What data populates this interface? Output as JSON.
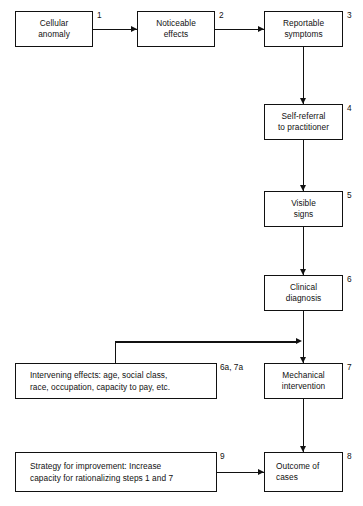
{
  "diagram": {
    "type": "flowchart",
    "width": 363,
    "height": 506,
    "background_color": "#ffffff",
    "line_color": "#111111"
  },
  "nodes": [
    {
      "id": "n1",
      "tag": "1",
      "label": "Cellular\nanomaly",
      "x": 15,
      "y": 11,
      "w": 78,
      "h": 36,
      "align": "center"
    },
    {
      "id": "n2",
      "tag": "2",
      "label": "Noticeable\neffects",
      "x": 137,
      "y": 11,
      "w": 78,
      "h": 36,
      "align": "center"
    },
    {
      "id": "n3",
      "tag": "3",
      "label": "Reportable\nsymptoms",
      "x": 264,
      "y": 11,
      "w": 79,
      "h": 36,
      "align": "center"
    },
    {
      "id": "n4",
      "tag": "4",
      "label": "Self-referral\nto practitioner",
      "x": 264,
      "y": 104,
      "w": 79,
      "h": 36,
      "align": "center"
    },
    {
      "id": "n5",
      "tag": "5",
      "label": "Visible\nsigns",
      "x": 264,
      "y": 191,
      "w": 79,
      "h": 36,
      "align": "center"
    },
    {
      "id": "n6",
      "tag": "6",
      "label": "Clinical\ndiagnosis",
      "x": 264,
      "y": 275,
      "w": 79,
      "h": 36,
      "align": "center"
    },
    {
      "id": "n6a7a",
      "tag": "6a, 7a",
      "label": "Intervening effects: age, social class,\nrace, occupation, capacity to pay, etc.",
      "x": 15,
      "y": 363,
      "w": 202,
      "h": 36,
      "align": "left"
    },
    {
      "id": "n7",
      "tag": "7",
      "label": "Mechanical\nintervention",
      "x": 264,
      "y": 363,
      "w": 79,
      "h": 36,
      "align": "center"
    },
    {
      "id": "n9",
      "tag": "9",
      "label": "Strategy for improvement: Increase\ncapacity for rationalizing steps 1 and 7",
      "x": 15,
      "y": 452,
      "w": 202,
      "h": 40,
      "align": "left"
    },
    {
      "id": "n8",
      "tag": "8",
      "label": "Outcome of\ncases",
      "x": 264,
      "y": 452,
      "w": 79,
      "h": 40,
      "align": "leftish"
    }
  ],
  "edges": [
    {
      "from": "n1",
      "to": "n2",
      "kind": "horizontal-arrow"
    },
    {
      "from": "n2",
      "to": "n3",
      "kind": "horizontal-arrow"
    },
    {
      "from": "n3",
      "to": "n4",
      "kind": "vertical-arrow"
    },
    {
      "from": "n4",
      "to": "n5",
      "kind": "vertical-arrow"
    },
    {
      "from": "n5",
      "to": "n6",
      "kind": "vertical-arrow"
    },
    {
      "from": "n6",
      "to": "n7",
      "kind": "vertical-arrow"
    },
    {
      "from": "n6a7a",
      "to": "n7",
      "kind": "elbow-arrow"
    },
    {
      "from": "n7",
      "to": "n8",
      "kind": "vertical-arrow"
    },
    {
      "from": "n9",
      "to": "n8",
      "kind": "horizontal-arrow"
    }
  ]
}
